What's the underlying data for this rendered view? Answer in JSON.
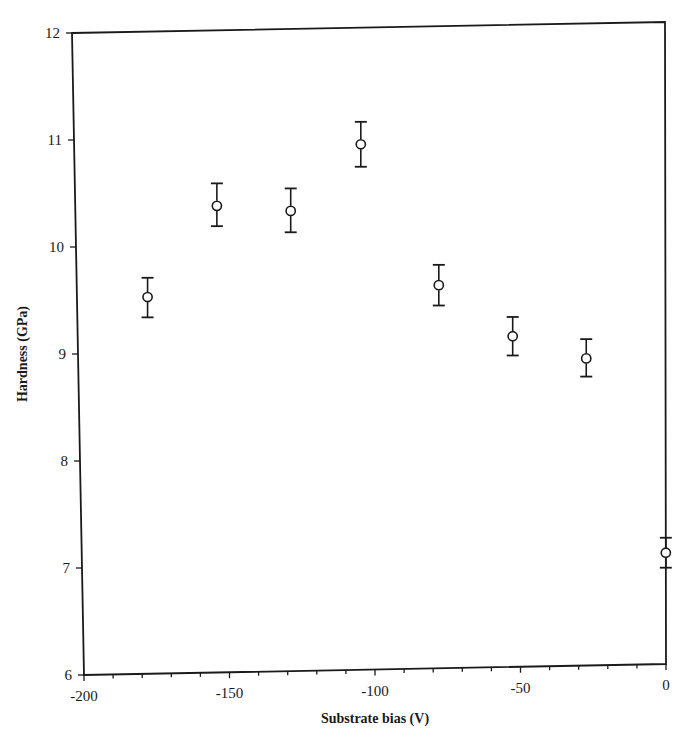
{
  "chart_data": {
    "type": "scatter",
    "title": "",
    "xlabel": "Substrate bias (V)",
    "ylabel": "Hardness (GPa)",
    "xlim": [
      -200,
      0
    ],
    "ylim": [
      6,
      12
    ],
    "x_ticks": [
      -200,
      -150,
      -100,
      -50,
      0
    ],
    "x_tick_labels": [
      "-200",
      "-150",
      "-100",
      "-50",
      "0"
    ],
    "x_minor_step": 10,
    "y_ticks": [
      6,
      7,
      8,
      9,
      10,
      11,
      12
    ],
    "y_tick_labels": [
      "6",
      "7",
      "8",
      "9",
      "10",
      "11",
      "12"
    ],
    "grid": false,
    "legend": null,
    "marker": "open-circle",
    "error_bars": true,
    "series": [
      {
        "name": "Hardness",
        "points": [
          {
            "x": -176,
            "y": 9.52,
            "y_low": 9.33,
            "y_high": 9.7
          },
          {
            "x": -152,
            "y": 10.36,
            "y_low": 10.17,
            "y_high": 10.57
          },
          {
            "x": -127,
            "y": 10.3,
            "y_low": 10.1,
            "y_high": 10.51
          },
          {
            "x": -103,
            "y": 10.91,
            "y_low": 10.7,
            "y_high": 11.12
          },
          {
            "x": -77,
            "y": 9.58,
            "y_low": 9.39,
            "y_high": 9.77
          },
          {
            "x": -52,
            "y": 9.09,
            "y_low": 8.91,
            "y_high": 9.27
          },
          {
            "x": -27,
            "y": 8.87,
            "y_low": 8.7,
            "y_high": 9.05
          },
          {
            "x": 0,
            "y": 7.04,
            "y_low": 6.9,
            "y_high": 7.18
          }
        ]
      }
    ]
  },
  "colors": {
    "ink": "#1a1a1a",
    "background": "#ffffff"
  }
}
